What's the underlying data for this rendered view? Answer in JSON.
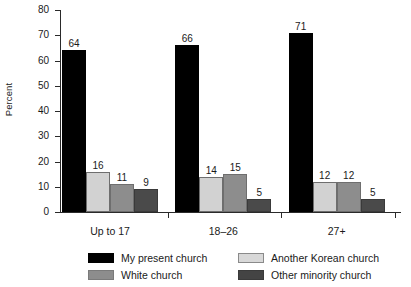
{
  "chart_data": {
    "type": "bar",
    "title": "",
    "subtitle": "",
    "xlabel": "",
    "ylabel": "Percent",
    "categories": [
      "Up to 17",
      "18–26",
      "27+"
    ],
    "series": [
      {
        "name": "My present church",
        "color": "#000000",
        "values": [
          64,
          66,
          71
        ]
      },
      {
        "name": "Another Korean church",
        "color": "#d2d2d2",
        "values": [
          16,
          14,
          12
        ]
      },
      {
        "name": "White church",
        "color": "#8d8d8d",
        "values": [
          11,
          15,
          12
        ]
      },
      {
        "name": "Other minority church",
        "color": "#4a4a4a",
        "values": [
          9,
          5,
          5
        ]
      }
    ],
    "ylim": [
      0,
      80
    ],
    "yticks": [
      0,
      10,
      20,
      30,
      40,
      50,
      60,
      70,
      80
    ],
    "ytick_labels": [
      "0",
      "10",
      "20",
      "30",
      "40",
      "50",
      "60",
      "70",
      "80"
    ],
    "grid": false,
    "legend_position": "bottom",
    "bar_order_in_group": [
      "My present church",
      "Another Korean church",
      "White church",
      "Other minority church"
    ],
    "data_labels": [
      {
        "group": "Up to 17",
        "labels": [
          "64",
          "16",
          "11",
          "9"
        ]
      },
      {
        "group": "18–26",
        "labels": [
          "66",
          "14",
          "15",
          "5"
        ]
      },
      {
        "group": "27+",
        "labels": [
          "71",
          "12",
          "12",
          "5"
        ]
      }
    ]
  },
  "axis": {
    "y_label": "Percent",
    "y_ticks": [
      "80",
      "70",
      "60",
      "50",
      "40",
      "30",
      "20",
      "10",
      "0"
    ]
  },
  "groups": [
    {
      "label": "Up to 17",
      "bars": [
        {
          "series": "My present church",
          "value": "64",
          "swatch": "sw-present"
        },
        {
          "series": "Another Korean church",
          "value": "16",
          "swatch": "sw-korean"
        },
        {
          "series": "White church",
          "value": "11",
          "swatch": "sw-white"
        },
        {
          "series": "Other minority church",
          "value": "9",
          "swatch": "sw-minority"
        }
      ]
    },
    {
      "label": "18–26",
      "bars": [
        {
          "series": "My present church",
          "value": "66",
          "swatch": "sw-present"
        },
        {
          "series": "Another Korean church",
          "value": "14",
          "swatch": "sw-korean"
        },
        {
          "series": "White church",
          "value": "15",
          "swatch": "sw-white"
        },
        {
          "series": "Other minority church",
          "value": "5",
          "swatch": "sw-minority"
        }
      ]
    },
    {
      "label": "27+",
      "bars": [
        {
          "series": "My present church",
          "value": "71",
          "swatch": "sw-present"
        },
        {
          "series": "Another Korean church",
          "value": "12",
          "swatch": "sw-korean"
        },
        {
          "series": "White church",
          "value": "12",
          "swatch": "sw-white"
        },
        {
          "series": "Other minority church",
          "value": "5",
          "swatch": "sw-minority"
        }
      ]
    }
  ],
  "legend": {
    "items": [
      {
        "label": "My present church",
        "swatch": "sw-present",
        "color": "#000000"
      },
      {
        "label": "Another Korean church",
        "swatch": "sw-korean",
        "color": "#d8d8d8"
      },
      {
        "label": "White church",
        "swatch": "sw-white",
        "color": "#8d8d8d"
      },
      {
        "label": "Other minority church",
        "swatch": "sw-minority",
        "color": "#444444"
      }
    ]
  }
}
